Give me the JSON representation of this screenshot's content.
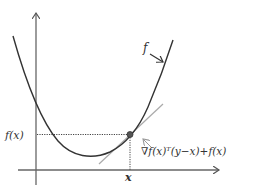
{
  "diagram": {
    "type": "convex-function-first-order-condition",
    "axes": {
      "x_tick_label": "x",
      "y_tick_label": "f(x)"
    },
    "curve_label": "f",
    "tangent_label": "∇f(x)ᵀ(y−x)+f(x)",
    "colors": {
      "curve": "#333333",
      "axes": "#555555",
      "tangent": "#aaaaaa",
      "point": "#444444",
      "guide": "#444444"
    }
  }
}
